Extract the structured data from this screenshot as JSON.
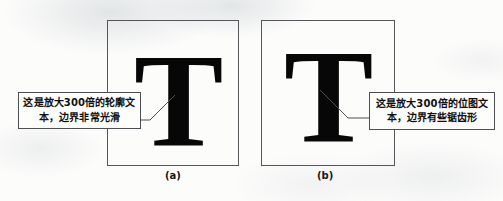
{
  "figure": {
    "panels": [
      {
        "id": "a",
        "caption": "(a)",
        "glyph": "T",
        "glyph_name": "letter-t-outline",
        "callout": {
          "line_1": "这是放大300倍的轮廓文",
          "line_2": "本，边界非常光滑"
        }
      },
      {
        "id": "b",
        "caption": "(b)",
        "glyph": "T",
        "glyph_name": "letter-t-bitmap",
        "callout": {
          "line_1": "这是放大300倍的位图文",
          "line_2": "本，边界有些锯齿形"
        }
      }
    ],
    "ghost_marks": {
      "left": "",
      "center": "",
      "right": ""
    },
    "colors": {
      "page_background": "#fcfcfb",
      "panel_border": "#55565a",
      "callout_border": "#4d4e52",
      "callout_background": "#fdfdfc",
      "glyph_fill": "#070707",
      "text": "#101010",
      "leader_line": "#4d4e52"
    }
  }
}
